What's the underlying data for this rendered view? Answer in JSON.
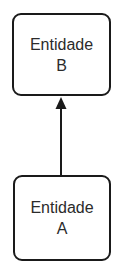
{
  "diagram": {
    "nodes": [
      {
        "id": "B",
        "line1": "Entidade",
        "line2": "B"
      },
      {
        "id": "A",
        "line1": "Entidade",
        "line2": "A"
      }
    ],
    "edges": [
      {
        "from": "A",
        "to": "B",
        "type": "arrow"
      }
    ],
    "colors": {
      "stroke": "#1a1a1a",
      "text": "#2b2b2b",
      "background": "#ffffff"
    }
  }
}
